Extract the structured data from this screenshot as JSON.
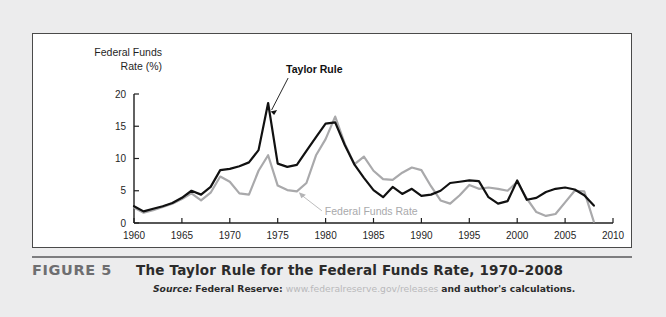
{
  "figure": {
    "number_label": "FIGURE 5",
    "title": "The Taylor Rule for the Federal Funds Rate, 1970–2008",
    "source_label": "Source:",
    "source_org": "Federal Reserve:",
    "source_url": "www.federalreserve.gov/releases",
    "source_tail": "and author's calculations."
  },
  "chart_data": {
    "type": "line",
    "title": "",
    "xlabel": "",
    "ylabel": "Federal Funds Rate (%)",
    "ylabel_line1": "Federal Funds",
    "ylabel_line2": "Rate (%)",
    "xlim": [
      1960,
      2010
    ],
    "ylim": [
      0,
      20
    ],
    "yticks": [
      0,
      5,
      10,
      15,
      20
    ],
    "ytick_labels": [
      "0",
      "5",
      "10",
      "15",
      "20"
    ],
    "xticks": [
      1960,
      1965,
      1970,
      1975,
      1980,
      1985,
      1990,
      1995,
      2000,
      2005,
      2010
    ],
    "xtick_labels": [
      "1960",
      "1965",
      "1970",
      "1975",
      "1980",
      "1985",
      "1990",
      "1995",
      "2000",
      "2005",
      "2010"
    ],
    "grid": false,
    "legend_position": "inline-annotations",
    "annotations": [
      {
        "text": "Taylor Rule",
        "series": "Taylor Rule",
        "color": "#111111",
        "points_to_x": 1974,
        "points_to_y": 18.6
      },
      {
        "text": "Federal Funds Rate",
        "series": "Federal Funds Rate",
        "color": "#a9a9ab",
        "points_to_x": 1977,
        "points_to_y": 5.3
      }
    ],
    "x": [
      1960,
      1961,
      1962,
      1963,
      1964,
      1965,
      1966,
      1967,
      1968,
      1969,
      1970,
      1971,
      1972,
      1973,
      1974,
      1975,
      1976,
      1977,
      1978,
      1979,
      1980,
      1981,
      1982,
      1983,
      1984,
      1985,
      1986,
      1987,
      1988,
      1989,
      1990,
      1991,
      1992,
      1993,
      1994,
      1995,
      1996,
      1997,
      1998,
      1999,
      2000,
      2001,
      2002,
      2003,
      2004,
      2005,
      2006,
      2007,
      2008
    ],
    "series": [
      {
        "name": "Taylor Rule",
        "color": "#111111",
        "width": 2.2,
        "values": [
          2.6,
          1.8,
          2.2,
          2.6,
          3.1,
          3.9,
          5.0,
          4.4,
          5.6,
          8.2,
          8.4,
          8.8,
          9.4,
          11.3,
          18.6,
          9.2,
          8.7,
          9.0,
          11.2,
          13.3,
          15.4,
          15.6,
          12.1,
          9.1,
          7.0,
          5.1,
          4.0,
          5.6,
          4.5,
          5.3,
          4.2,
          4.4,
          5.0,
          6.2,
          6.4,
          6.6,
          6.5,
          4.0,
          3.0,
          3.4,
          6.6,
          3.6,
          3.9,
          4.8,
          5.3,
          5.5,
          5.2,
          4.3,
          2.7
        ]
      },
      {
        "name": "Federal Funds Rate",
        "color": "#a9a9ab",
        "width": 2.2,
        "values": [
          2.4,
          1.6,
          2.0,
          2.5,
          3.0,
          3.7,
          4.6,
          3.5,
          4.7,
          7.2,
          6.4,
          4.6,
          4.4,
          8.1,
          10.5,
          5.8,
          5.1,
          4.9,
          6.2,
          10.5,
          13.0,
          16.5,
          12.3,
          9.1,
          10.3,
          8.1,
          6.8,
          6.7,
          7.8,
          8.6,
          8.2,
          5.7,
          3.5,
          3.0,
          4.3,
          5.9,
          5.3,
          5.5,
          5.3,
          5.0,
          6.4,
          3.8,
          1.7,
          1.1,
          1.4,
          3.2,
          5.0,
          4.9,
          0.2
        ]
      }
    ]
  }
}
